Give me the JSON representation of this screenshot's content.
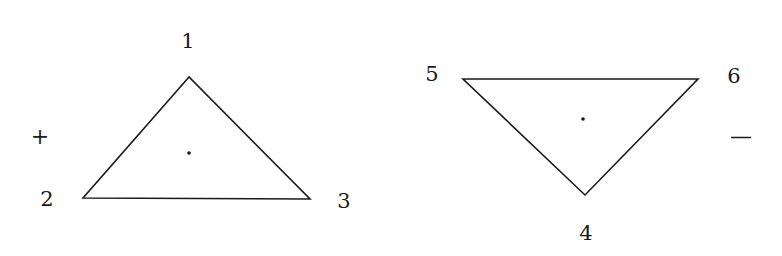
{
  "diagram": {
    "line_color": "#1a1a1a",
    "background": "#ffffff",
    "triangles": [
      {
        "id": "upward",
        "sign": "+",
        "vertices": [
          {
            "label": "1",
            "x": 189,
            "y": 77
          },
          {
            "label": "2",
            "x": 83,
            "y": 198
          },
          {
            "label": "3",
            "x": 310,
            "y": 199
          }
        ],
        "center_dot": {
          "x": 189,
          "y": 153
        }
      },
      {
        "id": "downward",
        "sign": "—",
        "vertices": [
          {
            "label": "4",
            "x": 585,
            "y": 195
          },
          {
            "label": "5",
            "x": 463,
            "y": 79
          },
          {
            "label": "6",
            "x": 698,
            "y": 79
          }
        ],
        "center_dot": {
          "x": 583,
          "y": 119
        }
      }
    ]
  }
}
